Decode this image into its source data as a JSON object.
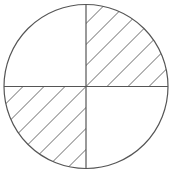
{
  "diagram": {
    "type": "fraction-circle",
    "total_parts": 4,
    "shaded_parts": 2,
    "shaded_quadrants": [
      "top-right",
      "bottom-left"
    ],
    "unshaded_quadrants": [
      "top-left",
      "bottom-right"
    ],
    "circle": {
      "cx": 86,
      "cy": 86.5,
      "r": 82
    },
    "hatch": {
      "angle_deg": 45,
      "spacing_px": 21,
      "direction": "lower-left-to-upper-right"
    },
    "colors": {
      "background": "#ffffff",
      "stroke": "#555555",
      "hatch": "#6a6a6a"
    }
  }
}
